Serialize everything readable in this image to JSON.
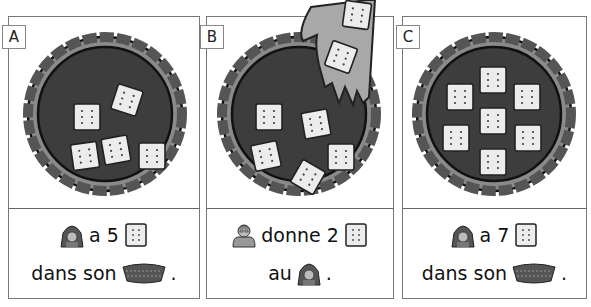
{
  "panels": [
    {
      "id": "A",
      "label": "A",
      "cracker_count": 5,
      "caption": {
        "line1": {
          "icon1": "red-riding-hood-icon",
          "text": "a 5",
          "icon2": "cracker-icon"
        },
        "line2": {
          "text": "dans son",
          "icon": "basket-icon",
          "end": "."
        }
      }
    },
    {
      "id": "B",
      "label": "B",
      "cracker_count": 5,
      "hand_crackers": 2,
      "caption": {
        "line1": {
          "icon1": "grandmother-icon",
          "text": "donne 2",
          "icon2": "cracker-icon"
        },
        "line2": {
          "text": "au",
          "icon": "red-riding-hood-icon",
          "end": "."
        }
      }
    },
    {
      "id": "C",
      "label": "C",
      "cracker_count": 7,
      "caption": {
        "line1": {
          "icon1": "red-riding-hood-icon",
          "text": "a 7",
          "icon2": "cracker-icon"
        },
        "line2": {
          "text": "dans son",
          "icon": "basket-icon",
          "end": "."
        }
      }
    }
  ],
  "colors": {
    "basket_fill": "#3d3d3d",
    "basket_rim": "#8a8a8a",
    "cracker": "#ececec",
    "hand": "#a8a8a8",
    "border": "#777777"
  }
}
